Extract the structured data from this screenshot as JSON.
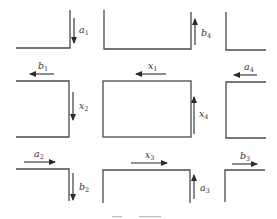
{
  "diagram": {
    "type": "traffic-network",
    "flows": [
      {
        "id": "a1",
        "base": "a",
        "sub": "1",
        "direction": "down"
      },
      {
        "id": "b1",
        "base": "b",
        "sub": "1",
        "direction": "left"
      },
      {
        "id": "x2",
        "base": "x",
        "sub": "2",
        "direction": "down"
      },
      {
        "id": "x1",
        "base": "x",
        "sub": "1",
        "direction": "left"
      },
      {
        "id": "b4",
        "base": "b",
        "sub": "4",
        "direction": "up"
      },
      {
        "id": "a4",
        "base": "a",
        "sub": "4",
        "direction": "left"
      },
      {
        "id": "x4",
        "base": "x",
        "sub": "4",
        "direction": "up"
      },
      {
        "id": "a2",
        "base": "a",
        "sub": "2",
        "direction": "right"
      },
      {
        "id": "b2",
        "base": "b",
        "sub": "2",
        "direction": "down"
      },
      {
        "id": "x3",
        "base": "x",
        "sub": "3",
        "direction": "right"
      },
      {
        "id": "a3",
        "base": "a",
        "sub": "3",
        "direction": "up"
      },
      {
        "id": "b3",
        "base": "b",
        "sub": "3",
        "direction": "right"
      }
    ],
    "caption": ""
  },
  "labels": {
    "a1": {
      "base": "a",
      "sub": "1"
    },
    "b1": {
      "base": "b",
      "sub": "1"
    },
    "x2": {
      "base": "x",
      "sub": "2"
    },
    "x1": {
      "base": "x",
      "sub": "1"
    },
    "b4": {
      "base": "b",
      "sub": "4"
    },
    "a4": {
      "base": "a",
      "sub": "4"
    },
    "x4": {
      "base": "x",
      "sub": "4"
    },
    "a2": {
      "base": "a",
      "sub": "2"
    },
    "b2": {
      "base": "b",
      "sub": "2"
    },
    "x3": {
      "base": "x",
      "sub": "3"
    },
    "a3": {
      "base": "a",
      "sub": "3"
    },
    "b3": {
      "base": "b",
      "sub": "3"
    }
  },
  "colors": {
    "road": "#4a4a4a",
    "arrow": "#2a2a2a",
    "background": "#ffffff"
  }
}
